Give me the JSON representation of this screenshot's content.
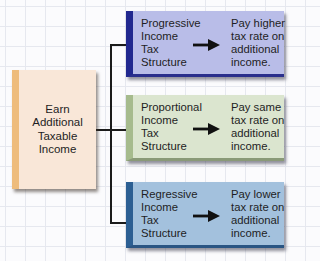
{
  "source": {
    "label": "Earn\nAdditional\nTaxable\nIncome",
    "color": "#f9e7d8",
    "accent": "#eebc7c"
  },
  "structures": [
    {
      "name": "Progressive\nIncome\nTax\nStructure",
      "effect": "Pay higher\ntax rate on\nadditional\nincome.",
      "arrow_icon": "right-arrow-icon",
      "fill": "#b9bde8",
      "accent": "#21288f"
    },
    {
      "name": "Proportional\nIncome\nTax\nStructure",
      "effect": "Pay same\ntax rate on\nadditional\nincome.",
      "arrow_icon": "right-arrow-icon",
      "fill": "#dbe5cf",
      "accent": "#a6bb8d"
    },
    {
      "name": "Regressive\nIncome\nTax\nStructure",
      "effect": "Pay lower\ntax rate on\nadditional\nincome.",
      "arrow_icon": "right-arrow-icon",
      "fill": "#a3c1dd",
      "accent": "#2c5f93"
    }
  ]
}
